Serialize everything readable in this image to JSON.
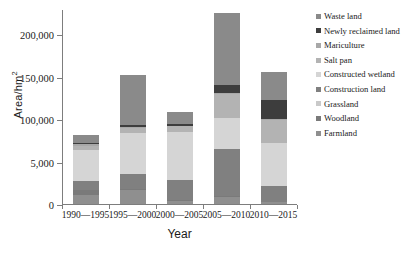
{
  "chart_data": {
    "type": "bar",
    "subtype": "stacked-bar",
    "title": "",
    "xlabel": "Year",
    "ylabel": "Area/hm2",
    "ylabel_display": "Area/hm",
    "ylabel_superscript": "2",
    "categories": [
      "1990—1995",
      "1995—2000",
      "2000—2005",
      "2005—2010",
      "2010—2015"
    ],
    "ylim": [
      0,
      230000
    ],
    "yticks": [
      0,
      50000,
      100000,
      150000,
      200000
    ],
    "ytick_labels": [
      "0",
      "5,000",
      "100,000",
      "150,000",
      "200,000"
    ],
    "grid": false,
    "legend_position": "right",
    "stack_order_bottom_to_top": [
      "Farmland",
      "Woodland",
      "Grassland",
      "Construction land",
      "Constructed wetland",
      "Salt pan",
      "Mariculture",
      "Newly reclaimed land",
      "Waste land"
    ],
    "series": [
      {
        "name": "Farmland",
        "color": "#8f8f8f",
        "values": [
          10200,
          16200,
          3200,
          8800,
          1800
        ]
      },
      {
        "name": "Woodland",
        "color": "#7a7a7a",
        "values": [
          6400,
          1600,
          1200,
          800,
          700
        ]
      },
      {
        "name": "Grassland",
        "color": "#c9c9c9",
        "values": [
          300,
          400,
          200,
          400,
          300
        ]
      },
      {
        "name": "Construction land",
        "color": "#808080",
        "values": [
          10600,
          17400,
          24000,
          55200,
          19000
        ]
      },
      {
        "name": "Constructed wetland",
        "color": "#d5d5d5",
        "values": [
          36200,
          48200,
          55800,
          36800,
          50800
        ]
      },
      {
        "name": "Salt pan",
        "color": "#b3b3b3",
        "values": [
          5200,
          5400,
          7400,
          27400,
          26800
        ]
      },
      {
        "name": "Mariculture",
        "color": "#a8a8a8",
        "values": [
          1800,
          1200,
          800,
          1600,
          1000
        ]
      },
      {
        "name": "Newly reclaimed land",
        "color": "#3d3d3d",
        "values": [
          1800,
          2400,
          2400,
          9200,
          22800
        ]
      },
      {
        "name": "Waste land",
        "color": "#8a8a8a",
        "values": [
          8500,
          59200,
          14000,
          84800,
          32800
        ]
      }
    ]
  },
  "legend": {
    "items": [
      {
        "label": "Waste land",
        "color": "#8a8a8a"
      },
      {
        "label": "Newly reclaimed land",
        "color": "#3d3d3d"
      },
      {
        "label": "Mariculture",
        "color": "#a8a8a8"
      },
      {
        "label": "Salt pan",
        "color": "#b3b3b3"
      },
      {
        "label": "Constructed wetland",
        "color": "#d5d5d5"
      },
      {
        "label": "Construction land",
        "color": "#808080"
      },
      {
        "label": "Grassland",
        "color": "#c9c9c9"
      },
      {
        "label": "Woodland",
        "color": "#7a7a7a"
      },
      {
        "label": "Farmland",
        "color": "#8f8f8f"
      }
    ]
  }
}
